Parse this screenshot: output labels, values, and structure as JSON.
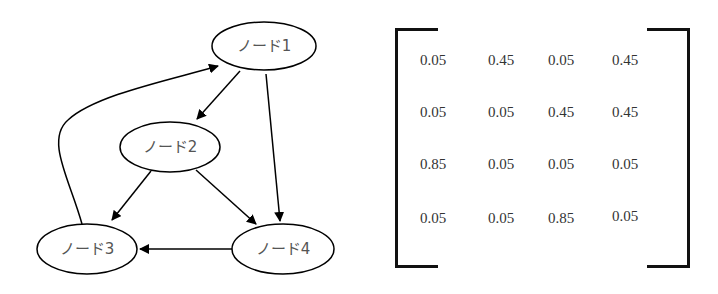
{
  "graph": {
    "nodes": [
      {
        "id": "n1",
        "label": "ノード1",
        "cx": 264,
        "cy": 46,
        "rx": 52,
        "ry": 24
      },
      {
        "id": "n2",
        "label": "ノード2",
        "cx": 170,
        "cy": 147,
        "rx": 50,
        "ry": 25
      },
      {
        "id": "n3",
        "label": "ノード3",
        "cx": 87,
        "cy": 249,
        "rx": 50,
        "ry": 25
      },
      {
        "id": "n4",
        "label": "ノード4",
        "cx": 283,
        "cy": 249,
        "rx": 51,
        "ry": 25
      }
    ],
    "edges": [
      {
        "from": "ノード1",
        "to": "ノード2"
      },
      {
        "from": "ノード1",
        "to": "ノード4"
      },
      {
        "from": "ノード2",
        "to": "ノード3"
      },
      {
        "from": "ノード2",
        "to": "ノード4"
      },
      {
        "from": "ノード4",
        "to": "ノード3"
      },
      {
        "from": "ノード3",
        "to": "ノード1"
      }
    ]
  },
  "matrix": {
    "rows": [
      [
        "0.05",
        "0.45",
        "0.05",
        "0.45"
      ],
      [
        "0.05",
        "0.05",
        "0.45",
        "0.45"
      ],
      [
        "0.85",
        "0.05",
        "0.05",
        "0.05"
      ],
      [
        "0.05",
        "0.05",
        "0.85",
        "0.05"
      ]
    ]
  }
}
